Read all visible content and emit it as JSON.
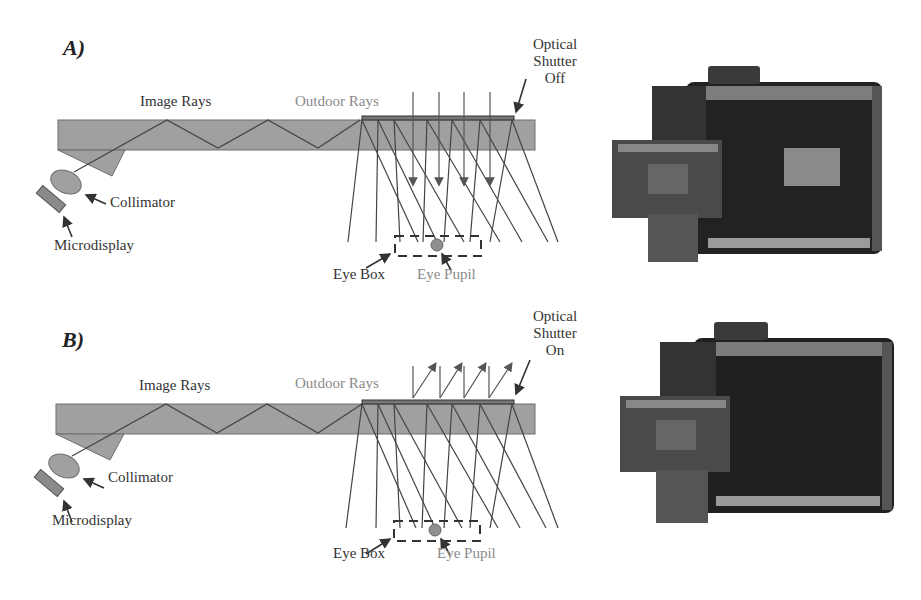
{
  "figure": {
    "panels": [
      {
        "id": "A",
        "label": "A)",
        "labels": {
          "image_rays": "Image Rays",
          "outdoor_rays": "Outdoor Rays",
          "shutter_line1": "Optical",
          "shutter_line2": "Shutter",
          "shutter_state": "Off",
          "collimator": "Collimator",
          "microdisplay": "Microdisplay",
          "eye_box": "Eye Box",
          "eye_pupil": "Eye Pupil"
        },
        "outdoor_ray_direction": "transmitted-down",
        "photo_description": "prototype display with visible see-through window"
      },
      {
        "id": "B",
        "label": "B)",
        "labels": {
          "image_rays": "Image Rays",
          "outdoor_rays": "Outdoor Rays",
          "shutter_line1": "Optical",
          "shutter_line2": "Shutter",
          "shutter_state": "On",
          "collimator": "Collimator",
          "microdisplay": "Microdisplay",
          "eye_box": "Eye Box",
          "eye_pupil": "Eye Pupil"
        },
        "outdoor_ray_direction": "reflected-up",
        "photo_description": "prototype display with opaque shutter"
      }
    ],
    "colors": {
      "waveguide": "#a0a0a0",
      "waveguide_edge": "#6e6e6e",
      "ray_line": "#444444",
      "pupil": "#8f8f8f",
      "photo_dark": "#1e1e1e"
    }
  }
}
